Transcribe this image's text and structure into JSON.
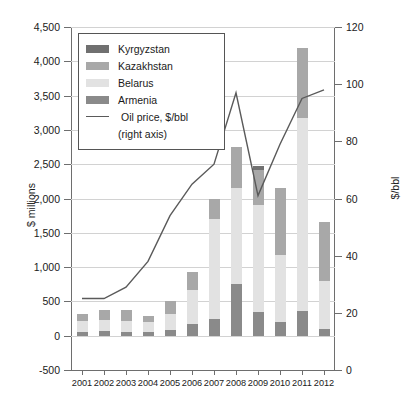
{
  "chart_data": {
    "type": "bar",
    "title": "",
    "xlabel": "",
    "ylabel": "$ millions",
    "ylabel_right": "$/bbl",
    "ylim": [
      -500,
      4500
    ],
    "ylim_right": [
      0,
      120
    ],
    "ytick_step": 500,
    "ytick_step_right": 20,
    "grid": true,
    "stacked": true,
    "legend_position": "upper-left-inside",
    "categories": [
      "2001",
      "2002",
      "2003",
      "2004",
      "2005",
      "2006",
      "2007",
      "2008",
      "2009",
      "2010",
      "2011",
      "2012"
    ],
    "ytick_labels": [
      "4,500",
      "4,000",
      "3,500",
      "3,000",
      "2,500",
      "2,000",
      "1,500",
      "1,000",
      "500",
      "0",
      "-500"
    ],
    "ytick_values": [
      4500,
      4000,
      3500,
      3000,
      2500,
      2000,
      1500,
      1000,
      500,
      0,
      -500
    ],
    "ytick_labels_right": [
      "120",
      "100",
      "80",
      "60",
      "40",
      "20",
      "0"
    ],
    "ytick_values_right": [
      120,
      100,
      80,
      60,
      40,
      20,
      0
    ],
    "series": [
      {
        "name": "Armenia",
        "color": "#8a8a8a",
        "values": [
          60,
          70,
          60,
          60,
          90,
          170,
          250,
          750,
          350,
          200,
          360,
          100
        ]
      },
      {
        "name": "Belarus",
        "color": "#e2e2e2",
        "values": [
          150,
          160,
          150,
          140,
          230,
          500,
          1450,
          1400,
          1550,
          980,
          2820,
          700
        ]
      },
      {
        "name": "Kazakhstan",
        "color": "#a8a8a8",
        "values": [
          100,
          140,
          170,
          90,
          190,
          260,
          300,
          600,
          520,
          970,
          1020,
          860
        ]
      },
      {
        "name": "Kyrgyzstan",
        "color": "#707070",
        "values": [
          0,
          0,
          0,
          0,
          0,
          0,
          0,
          0,
          60,
          0,
          0,
          0
        ]
      }
    ],
    "line_series": {
      "name": "Oil price, $/bbl",
      "axis": "right",
      "color": "#5a5a5a",
      "values": [
        25,
        25,
        29,
        38,
        54,
        65,
        72,
        97,
        61,
        79,
        95,
        98
      ]
    },
    "totals": [
      310,
      370,
      380,
      290,
      510,
      930,
      2000,
      2750,
      2480,
      2150,
      4200,
      1660
    ]
  },
  "legend": {
    "items": [
      {
        "label": "Kyrgyzstan",
        "swatch": "#707070",
        "type": "swatch"
      },
      {
        "label": "Kazakhstan",
        "swatch": "#a8a8a8",
        "type": "swatch"
      },
      {
        "label": "Belarus",
        "swatch": "#e2e2e2",
        "type": "swatch"
      },
      {
        "label": "Armenia",
        "swatch": "#8a8a8a",
        "type": "swatch"
      },
      {
        "label": "Oil price, $/bbl",
        "type": "line"
      },
      {
        "label": "(right axis)",
        "type": "sub"
      }
    ]
  }
}
